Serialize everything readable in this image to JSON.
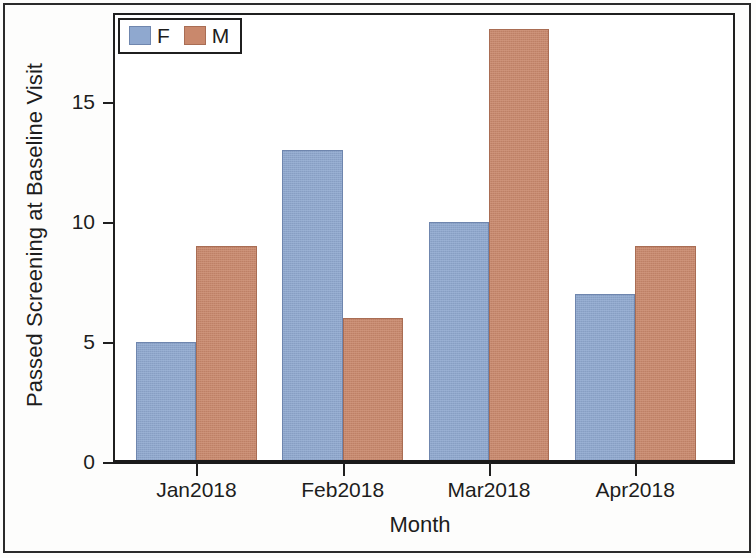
{
  "figure": {
    "background_color": "#ffffff",
    "frame_color": "#1f1f1f",
    "page_border_color": "#2b2b2b"
  },
  "legend": {
    "position": "top-left-inside-plot",
    "entries": [
      {
        "label": "F",
        "color": "#8fa8cf",
        "swatch_name": "legend-swatch-f"
      },
      {
        "label": "M",
        "color": "#c9886c",
        "swatch_name": "legend-swatch-m"
      }
    ]
  },
  "axes": {
    "y": {
      "title": "Passed Screening at Baseline Visit",
      "ticks": [
        "0",
        "5",
        "10",
        "15"
      ]
    },
    "x": {
      "title": "Month",
      "ticks": [
        "Jan2018",
        "Feb2018",
        "Mar2018",
        "Apr2018"
      ]
    }
  },
  "chart_data": {
    "type": "bar",
    "title": "",
    "subtitle": "",
    "xlabel": "Month",
    "ylabel": "Passed Screening at Baseline Visit",
    "categories": [
      "Jan2018",
      "Feb2018",
      "Mar2018",
      "Apr2018"
    ],
    "series": [
      {
        "name": "F",
        "color": "#8fa8cf",
        "values": [
          5,
          13,
          10,
          7
        ]
      },
      {
        "name": "M",
        "color": "#c9886c",
        "values": [
          9,
          6,
          18,
          9
        ]
      }
    ],
    "ylim": [
      0,
      18.6
    ],
    "yticks": [
      0,
      5,
      10,
      15
    ],
    "grid": false,
    "legend_position": "upper left",
    "bar_grouping": "clustered",
    "annotations": []
  }
}
